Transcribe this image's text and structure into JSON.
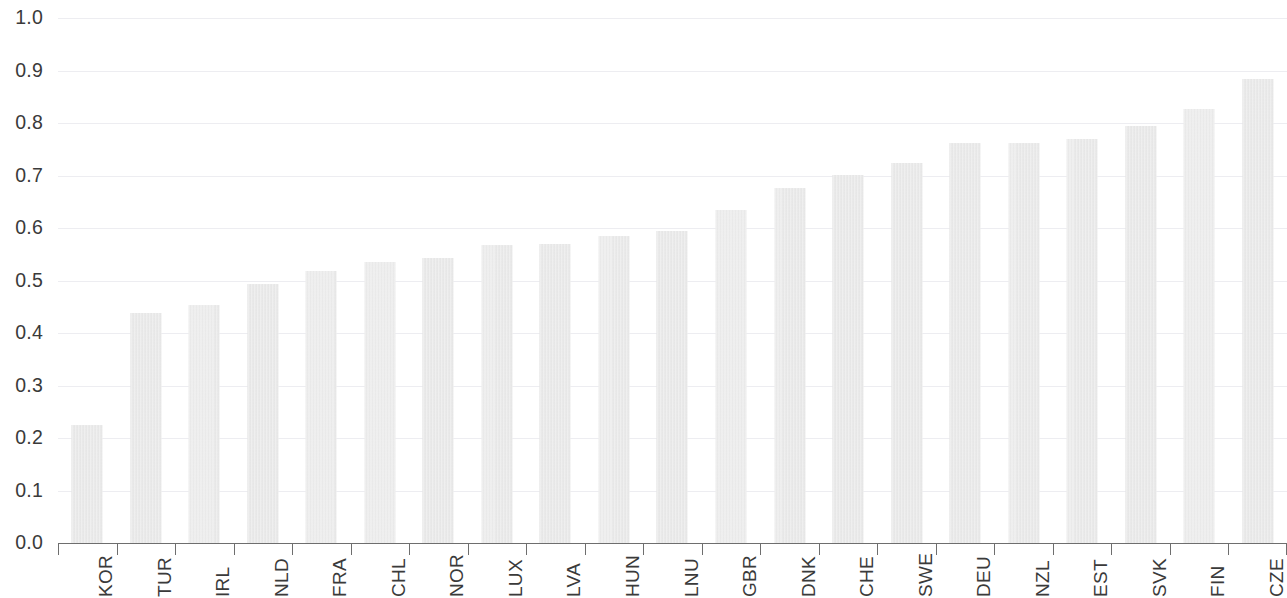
{
  "chart_data": {
    "type": "bar",
    "title": "",
    "subtitle": "",
    "xlabel": "",
    "ylabel": "",
    "ylim": [
      0.0,
      1.0
    ],
    "ytick_labels": [
      "0.0",
      "0.1",
      "0.2",
      "0.3",
      "0.4",
      "0.5",
      "0.6",
      "0.7",
      "0.8",
      "0.9",
      "1.0"
    ],
    "ytick_values": [
      0.0,
      0.1,
      0.2,
      0.3,
      0.4,
      0.5,
      0.6,
      0.7,
      0.8,
      0.9,
      1.0
    ],
    "grid": true,
    "grid_axis": "y",
    "legend": false,
    "legend_position": "none",
    "bar_color": "#e9e9e9",
    "grid_color": "#ededf1",
    "axis_color": "#6e6e6e",
    "text_color": "#3a3a3a",
    "categories": [
      "KOR",
      "TUR",
      "IRL",
      "NLD",
      "FRA",
      "CHL",
      "NOR",
      "LUX",
      "LVA",
      "HUN",
      "LNU",
      "GBR",
      "DNK",
      "CHE",
      "SWE",
      "DEU",
      "NZL",
      "EST",
      "SVK",
      "FIN",
      "CZE"
    ],
    "values": [
      0.225,
      0.438,
      0.453,
      0.494,
      0.518,
      0.535,
      0.543,
      0.567,
      0.569,
      0.585,
      0.595,
      0.634,
      0.676,
      0.701,
      0.724,
      0.761,
      0.761,
      0.77,
      0.794,
      0.826,
      0.883
    ],
    "annotations": []
  }
}
